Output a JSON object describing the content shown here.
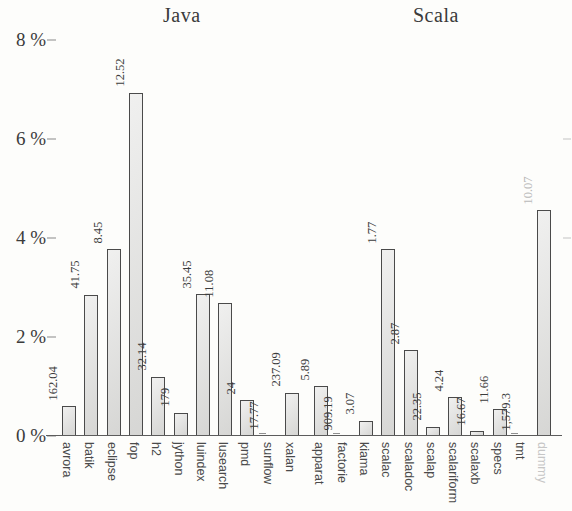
{
  "chart_data": {
    "type": "bar",
    "title": "",
    "xlabel": "",
    "ylabel": "",
    "ylim": [
      0,
      8
    ],
    "ytick_labels": [
      "0 %",
      "2 %",
      "4 %",
      "6 %",
      "8 %"
    ],
    "ytick_values": [
      0,
      2,
      4,
      6,
      8
    ],
    "grid": false,
    "legend": null,
    "groups": [
      {
        "name": "Java",
        "categories": [
          "avrora",
          "batik",
          "eclipse",
          "fop",
          "h2",
          "jython",
          "luindex",
          "lusearch",
          "pmd",
          "sunflow",
          "xalan"
        ],
        "values": [
          0.6,
          2.85,
          3.77,
          6.93,
          1.2,
          0.47,
          2.86,
          2.68,
          0.72,
          0.02,
          0.87
        ],
        "data_labels": [
          "162.04",
          "41.75",
          "8.45",
          "12.52",
          "32.14",
          "179",
          "35.45",
          "11.08",
          "24",
          "17.77",
          "237.09"
        ]
      },
      {
        "name": "Scala",
        "categories": [
          "apparat",
          "factorie",
          "kiama",
          "scalac",
          "scaladoc",
          "scalap",
          "scalariform",
          "scalaxb",
          "specs",
          "tmt",
          "dummy"
        ],
        "values": [
          1.01,
          0.0,
          0.31,
          3.77,
          1.73,
          0.19,
          0.78,
          0.1,
          0.54,
          0.0,
          4.56
        ],
        "data_labels": [
          "5.89",
          "909.19",
          "3.07",
          "1.77",
          "2.87",
          "22.35",
          "4.24",
          "16.67",
          "11.66",
          "1,579.3",
          "10.07"
        ]
      }
    ],
    "style": {
      "bar_fill": "#dededc",
      "bar_border": "#4a4a4a",
      "axis_color": "#5c5c5c",
      "text_color": "#3c3c3c",
      "faint_text_color": "#c6c6c6",
      "background": "#fdfdfb"
    },
    "faint_categories": [
      "dummy"
    ]
  }
}
